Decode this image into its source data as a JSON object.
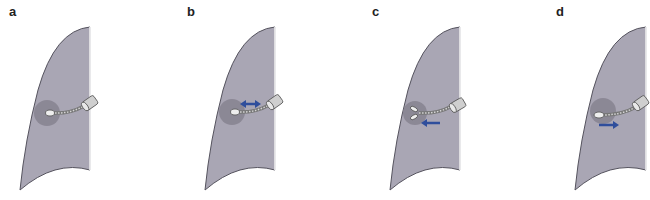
{
  "figure": {
    "colors": {
      "lung_fill": "#a9a6b4",
      "lung_edge": "#55535e",
      "lesion": "#86828f",
      "arrow": "#2f4e9c",
      "instrument": "#bdbdbd",
      "instrument_edge": "#555555"
    },
    "panels": [
      {
        "label": "a",
        "arrow": "none",
        "tip": "closed"
      },
      {
        "label": "b",
        "arrow": "double",
        "tip": "closed"
      },
      {
        "label": "c",
        "arrow": "left",
        "tip": "open-forceps"
      },
      {
        "label": "d",
        "arrow": "right",
        "tip": "closed"
      }
    ]
  }
}
